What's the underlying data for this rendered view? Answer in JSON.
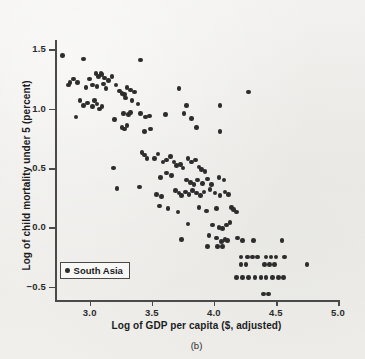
{
  "chart_data": {
    "type": "scatter",
    "title": "",
    "caption": "(b)",
    "xlabel": "Log of GDP per capita ($, adjusted)",
    "ylabel": "Log of child mortality under 5 (percent)",
    "xlim": [
      2.72,
      5.0
    ],
    "ylim": [
      -0.62,
      1.58
    ],
    "xticks": [
      3.0,
      3.5,
      4.0,
      4.5,
      5.0
    ],
    "xtick_labels": [
      "3.0",
      "3.5",
      "4.0",
      "4.5",
      "5.0"
    ],
    "yticks": [
      1.5,
      1.0,
      0.5,
      0.0,
      -0.5
    ],
    "ytick_labels": [
      "1.5",
      "1.0",
      "0.5",
      "0.0",
      "−0.5"
    ],
    "grid": false,
    "legend_position": "lower-left",
    "marker_color": "#2d2d2d",
    "background_color": "#efeeec",
    "axis_color": "#4a4a4a",
    "series": [
      {
        "name": "South Asia",
        "marker": "circle",
        "color": "#2d2d2d",
        "points": [
          [
            2.78,
            1.45
          ],
          [
            2.95,
            1.42
          ],
          [
            3.41,
            1.41
          ],
          [
            2.84,
            1.22
          ],
          [
            2.83,
            1.2
          ],
          [
            2.87,
            1.25
          ],
          [
            2.9,
            1.22
          ],
          [
            3.0,
            1.25
          ],
          [
            3.05,
            1.3
          ],
          [
            3.07,
            1.27
          ],
          [
            3.09,
            1.3
          ],
          [
            3.1,
            1.29
          ],
          [
            3.12,
            1.26
          ],
          [
            3.15,
            1.24
          ],
          [
            3.18,
            1.27
          ],
          [
            2.97,
            1.18
          ],
          [
            3.02,
            1.2
          ],
          [
            3.06,
            1.19
          ],
          [
            3.11,
            1.21
          ],
          [
            3.13,
            1.17
          ],
          [
            3.21,
            1.2
          ],
          [
            3.24,
            1.15
          ],
          [
            3.26,
            1.13
          ],
          [
            3.28,
            1.12
          ],
          [
            3.3,
            1.18
          ],
          [
            3.33,
            1.16
          ],
          [
            3.36,
            1.14
          ],
          [
            3.29,
            1.09
          ],
          [
            3.34,
            1.07
          ],
          [
            3.72,
            1.17
          ],
          [
            4.28,
            1.14
          ],
          [
            2.92,
            1.07
          ],
          [
            2.95,
            1.03
          ],
          [
            2.98,
            1.05
          ],
          [
            3.02,
            1.02
          ],
          [
            3.04,
            1.07
          ],
          [
            3.06,
            1.04
          ],
          [
            3.08,
            1.0
          ],
          [
            3.1,
            1.02
          ],
          [
            3.39,
            1.04
          ],
          [
            3.78,
            1.03
          ],
          [
            4.05,
            1.03
          ],
          [
            2.89,
            0.93
          ],
          [
            3.2,
            0.91
          ],
          [
            3.27,
            0.96
          ],
          [
            3.31,
            0.95
          ],
          [
            3.33,
            0.97
          ],
          [
            3.41,
            0.96
          ],
          [
            3.45,
            0.93
          ],
          [
            3.48,
            0.94
          ],
          [
            3.61,
            0.95
          ],
          [
            3.76,
            0.96
          ],
          [
            3.82,
            0.92
          ],
          [
            3.26,
            0.84
          ],
          [
            3.28,
            0.83
          ],
          [
            3.3,
            0.86
          ],
          [
            3.44,
            0.81
          ],
          [
            3.49,
            0.83
          ],
          [
            3.86,
            0.84
          ],
          [
            4.05,
            0.81
          ],
          [
            3.19,
            0.5
          ],
          [
            3.22,
            0.33
          ],
          [
            3.4,
            0.34
          ],
          [
            3.42,
            0.63
          ],
          [
            3.44,
            0.61
          ],
          [
            3.46,
            0.58
          ],
          [
            3.52,
            0.58
          ],
          [
            3.55,
            0.62
          ],
          [
            3.59,
            0.55
          ],
          [
            3.62,
            0.57
          ],
          [
            3.65,
            0.6
          ],
          [
            3.68,
            0.55
          ],
          [
            3.7,
            0.52
          ],
          [
            3.73,
            0.53
          ],
          [
            3.75,
            0.5
          ],
          [
            3.79,
            0.58
          ],
          [
            3.82,
            0.55
          ],
          [
            3.85,
            0.57
          ],
          [
            3.88,
            0.51
          ],
          [
            3.9,
            0.49
          ],
          [
            3.93,
            0.47
          ],
          [
            3.62,
            0.46
          ],
          [
            3.66,
            0.44
          ],
          [
            3.57,
            0.42
          ],
          [
            3.78,
            0.4
          ],
          [
            3.81,
            0.38
          ],
          [
            3.84,
            0.36
          ],
          [
            3.87,
            0.4
          ],
          [
            3.91,
            0.37
          ],
          [
            3.95,
            0.41
          ],
          [
            3.98,
            0.36
          ],
          [
            4.04,
            0.42
          ],
          [
            4.08,
            0.4
          ],
          [
            3.54,
            0.28
          ],
          [
            3.58,
            0.26
          ],
          [
            3.69,
            0.31
          ],
          [
            3.72,
            0.29
          ],
          [
            3.74,
            0.27
          ],
          [
            3.77,
            0.3
          ],
          [
            3.8,
            0.28
          ],
          [
            3.83,
            0.31
          ],
          [
            3.86,
            0.29
          ],
          [
            3.89,
            0.27
          ],
          [
            3.92,
            0.3
          ],
          [
            3.97,
            0.32
          ],
          [
            4.01,
            0.29
          ],
          [
            4.05,
            0.27
          ],
          [
            4.09,
            0.3
          ],
          [
            4.12,
            0.28
          ],
          [
            3.56,
            0.18
          ],
          [
            3.63,
            0.16
          ],
          [
            3.71,
            0.13
          ],
          [
            3.88,
            0.17
          ],
          [
            3.94,
            0.14
          ],
          [
            4.02,
            0.16
          ],
          [
            4.14,
            0.17
          ],
          [
            4.16,
            0.15
          ],
          [
            4.18,
            0.13
          ],
          [
            3.79,
            0.03
          ],
          [
            3.99,
            0.02
          ],
          [
            4.04,
            0.0
          ],
          [
            4.07,
            -0.01
          ],
          [
            4.1,
            0.02
          ],
          [
            4.13,
            0.04
          ],
          [
            3.74,
            -0.1
          ],
          [
            3.96,
            -0.07
          ],
          [
            4.02,
            -0.09
          ],
          [
            4.06,
            -0.12
          ],
          [
            4.09,
            -0.1
          ],
          [
            4.11,
            -0.11
          ],
          [
            4.19,
            -0.09
          ],
          [
            4.23,
            -0.11
          ],
          [
            4.32,
            -0.11
          ],
          [
            4.55,
            -0.11
          ],
          [
            3.95,
            -0.16
          ],
          [
            4.03,
            -0.16
          ],
          [
            4.07,
            -0.16
          ],
          [
            4.22,
            -0.25
          ],
          [
            4.27,
            -0.25
          ],
          [
            4.31,
            -0.25
          ],
          [
            4.35,
            -0.25
          ],
          [
            4.42,
            -0.25
          ],
          [
            4.46,
            -0.25
          ],
          [
            4.5,
            -0.25
          ],
          [
            4.57,
            -0.25
          ],
          [
            4.22,
            -0.31
          ],
          [
            4.26,
            -0.31
          ],
          [
            4.41,
            -0.31
          ],
          [
            4.45,
            -0.31
          ],
          [
            4.49,
            -0.31
          ],
          [
            4.75,
            -0.31
          ],
          [
            4.18,
            -0.42
          ],
          [
            4.23,
            -0.42
          ],
          [
            4.28,
            -0.42
          ],
          [
            4.33,
            -0.42
          ],
          [
            4.38,
            -0.42
          ],
          [
            4.42,
            -0.42
          ],
          [
            4.47,
            -0.42
          ],
          [
            4.52,
            -0.42
          ],
          [
            4.56,
            -0.42
          ],
          [
            4.4,
            -0.56
          ],
          [
            4.44,
            -0.56
          ]
        ]
      }
    ]
  },
  "legend": {
    "entries": [
      {
        "label": "South Asia",
        "marker_color": "#2d2d2d"
      }
    ]
  }
}
